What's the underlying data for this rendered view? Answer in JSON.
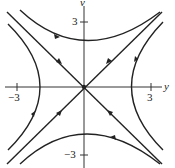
{
  "diagram": {
    "type": "phase-portrait-saddle",
    "axes": {
      "horizontal_label": "y",
      "vertical_label": "v",
      "horizontal_ticks": [
        "−3",
        "3"
      ],
      "vertical_ticks": [
        "3",
        "−3"
      ]
    },
    "curves": [
      {
        "name": "separatrix-stable",
        "description": "line v = -y, arrows toward origin"
      },
      {
        "name": "separatrix-unstable",
        "description": "line v = y, arrows away from origin"
      },
      {
        "name": "hyperbola-top",
        "direction": "left-to-right"
      },
      {
        "name": "hyperbola-bottom",
        "direction": "right-to-left"
      },
      {
        "name": "hyperbola-left",
        "direction": "downward"
      },
      {
        "name": "hyperbola-right",
        "direction": "upward"
      }
    ],
    "colors": {
      "stroke": "#222222",
      "background": "#ffffff"
    }
  }
}
